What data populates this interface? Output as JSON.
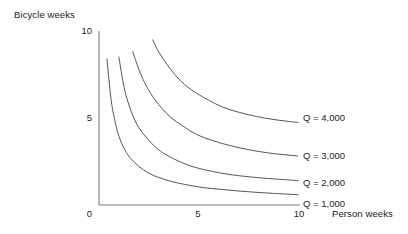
{
  "chart_data": {
    "type": "line",
    "title": "",
    "subtitle": "",
    "xlabel": "Person weeks",
    "ylabel": "Bicycle weeks",
    "xlim": [
      0,
      10.8
    ],
    "ylim": [
      0,
      10.4
    ],
    "xticks": [
      "0",
      "5",
      "10"
    ],
    "xtick_values": [
      0,
      5,
      10
    ],
    "yticks": [
      "0",
      "5",
      "10"
    ],
    "ytick_values": [
      0,
      5,
      10
    ],
    "grid": false,
    "legend_position": "inline-right-of-curves",
    "line_color": "#555555",
    "axis_color": "#7a7a7a",
    "series": [
      {
        "name": "Q = 1,000",
        "label": "Q = 1,000",
        "constant_k": 2.4,
        "x": [
          0.4,
          0.6,
          0.8,
          1.0,
          1.3,
          1.6,
          2.0,
          2.5,
          3.0,
          3.6,
          4.3,
          5.2,
          6.2,
          7.4,
          8.7,
          10.0
        ],
        "y": [
          8.5,
          6.2,
          4.9,
          4.0,
          3.2,
          2.7,
          2.25,
          1.85,
          1.6,
          1.38,
          1.2,
          1.02,
          0.9,
          0.78,
          0.68,
          0.6
        ]
      },
      {
        "name": "Q = 2,000",
        "label": "Q = 2,000",
        "constant_k": 4.1,
        "x": [
          1.0,
          1.2,
          1.4,
          1.7,
          2.0,
          2.4,
          2.9,
          3.4,
          4.1,
          4.8,
          5.7,
          6.7,
          7.9,
          9.0,
          10.0
        ],
        "y": [
          8.6,
          7.2,
          6.2,
          5.2,
          4.5,
          3.9,
          3.3,
          2.9,
          2.5,
          2.2,
          1.95,
          1.75,
          1.6,
          1.5,
          1.42
        ]
      },
      {
        "name": "Q = 3,000",
        "label": "Q = 3,000",
        "constant_k": 6.4,
        "x": [
          1.7,
          2.0,
          2.3,
          2.7,
          3.1,
          3.6,
          4.2,
          4.9,
          5.7,
          6.6,
          7.6,
          8.7,
          10.0
        ],
        "y": [
          8.9,
          7.9,
          7.1,
          6.3,
          5.7,
          5.1,
          4.6,
          4.1,
          3.75,
          3.45,
          3.2,
          3.0,
          2.85
        ]
      },
      {
        "name": "Q = 4,000",
        "label": "Q = 4,000",
        "constant_k": 9.6,
        "x": [
          2.7,
          3.0,
          3.4,
          3.8,
          4.3,
          4.9,
          5.5,
          6.2,
          7.0,
          7.9,
          8.9,
          10.0
        ],
        "y": [
          9.6,
          8.9,
          8.2,
          7.6,
          7.0,
          6.5,
          6.1,
          5.7,
          5.4,
          5.15,
          4.95,
          4.8
        ]
      }
    ]
  },
  "axes": {
    "y_title": "Bicycle weeks",
    "x_title": "Person weeks",
    "y_ticks": {
      "top": "10",
      "mid": "5",
      "zero": "0"
    },
    "x_ticks": {
      "mid": "5",
      "max": "10"
    }
  },
  "labels": {
    "q4000": "Q = 4,000",
    "q3000": "Q = 3,000",
    "q2000": "Q = 2,000",
    "q1000": "Q = 1,000"
  },
  "colors": {
    "curve": "#555555",
    "axis": "#7a7a7a",
    "text": "#1a1a1a",
    "background": "#ffffff"
  }
}
